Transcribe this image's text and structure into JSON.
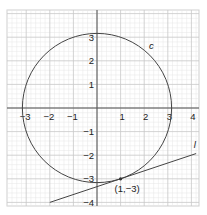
{
  "chart_data": {
    "type": "line",
    "title": "",
    "xlabel": "",
    "ylabel": "",
    "xlim": [
      -3.8,
      4.3
    ],
    "ylim": [
      -4.1,
      3.4
    ],
    "grid": true,
    "x_ticks": [
      -3,
      -2,
      -1,
      1,
      2,
      3,
      4
    ],
    "x_tick_labels": [
      "−3",
      "−2",
      "−1",
      "1",
      "2",
      "3",
      "4"
    ],
    "y_ticks": [
      3,
      2,
      1,
      -1,
      -2,
      -3,
      -4
    ],
    "y_tick_labels": [
      "3",
      "2",
      "1",
      "−1",
      "−2",
      "−3",
      "−4"
    ],
    "series": [
      {
        "name": "c",
        "kind": "circle",
        "equation": "x^2 + y^2 = 10",
        "center": [
          0,
          0
        ],
        "radius": 3.162
      },
      {
        "name": "l",
        "kind": "line",
        "equation": "x - 3y = 10",
        "x": [
          -2,
          4.2
        ],
        "y": [
          -4,
          -1.93
        ]
      }
    ],
    "annotations": [
      {
        "text": "(1,−3)",
        "x": 1,
        "y": -3,
        "marker": "point"
      },
      {
        "text": "c",
        "x": 2.2,
        "y": 2.5
      },
      {
        "text": "l",
        "x": 4.1,
        "y": -1.7
      }
    ]
  }
}
